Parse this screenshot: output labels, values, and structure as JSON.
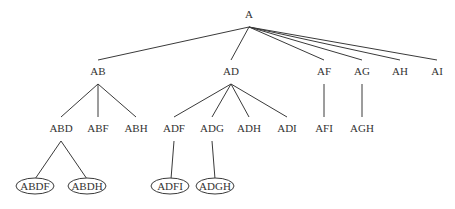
{
  "diagram": {
    "type": "tree",
    "colors": {
      "line": "#3a3a3a",
      "text": "#333333",
      "background": "#ffffff"
    },
    "nodes": [
      {
        "id": "A",
        "label": "A",
        "x": 249,
        "y": 14,
        "circled": false
      },
      {
        "id": "AB",
        "label": "AB",
        "x": 98,
        "y": 71,
        "circled": false
      },
      {
        "id": "AD",
        "label": "AD",
        "x": 231,
        "y": 71,
        "circled": false
      },
      {
        "id": "AF",
        "label": "AF",
        "x": 324,
        "y": 71,
        "circled": false
      },
      {
        "id": "AG",
        "label": "AG",
        "x": 362,
        "y": 71,
        "circled": false
      },
      {
        "id": "AH",
        "label": "AH",
        "x": 400,
        "y": 71,
        "circled": false
      },
      {
        "id": "AI",
        "label": "AI",
        "x": 437,
        "y": 71,
        "circled": false
      },
      {
        "id": "ABD",
        "label": "ABD",
        "x": 61,
        "y": 128,
        "circled": false
      },
      {
        "id": "ABF",
        "label": "ABF",
        "x": 98,
        "y": 128,
        "circled": false
      },
      {
        "id": "ABH",
        "label": "ABH",
        "x": 136,
        "y": 128,
        "circled": false
      },
      {
        "id": "ADF",
        "label": "ADF",
        "x": 174,
        "y": 128,
        "circled": false
      },
      {
        "id": "ADG",
        "label": "ADG",
        "x": 212,
        "y": 128,
        "circled": false
      },
      {
        "id": "ADH",
        "label": "ADH",
        "x": 249,
        "y": 128,
        "circled": false
      },
      {
        "id": "ADI",
        "label": "ADI",
        "x": 287,
        "y": 128,
        "circled": false
      },
      {
        "id": "AFI",
        "label": "AFI",
        "x": 324,
        "y": 128,
        "circled": false
      },
      {
        "id": "AGH",
        "label": "AGH",
        "x": 362,
        "y": 128,
        "circled": false
      },
      {
        "id": "ABDF",
        "label": "ABDF",
        "x": 35,
        "y": 186,
        "circled": true
      },
      {
        "id": "ABDH",
        "label": "ABDH",
        "x": 87,
        "y": 186,
        "circled": true
      },
      {
        "id": "ADFI",
        "label": "ADFI",
        "x": 170,
        "y": 186,
        "circled": true
      },
      {
        "id": "ADGH",
        "label": "ADGH",
        "x": 215,
        "y": 186,
        "circled": true
      }
    ],
    "edges": [
      {
        "from": "A",
        "to": "AB",
        "x1": 249,
        "y1": 27,
        "x2": 98,
        "y2": 60
      },
      {
        "from": "A",
        "to": "AD",
        "x1": 249,
        "y1": 27,
        "x2": 231,
        "y2": 60
      },
      {
        "from": "A",
        "to": "AF",
        "x1": 249,
        "y1": 27,
        "x2": 324,
        "y2": 60
      },
      {
        "from": "A",
        "to": "AG",
        "x1": 249,
        "y1": 27,
        "x2": 362,
        "y2": 60
      },
      {
        "from": "A",
        "to": "AH",
        "x1": 249,
        "y1": 27,
        "x2": 400,
        "y2": 60
      },
      {
        "from": "A",
        "to": "AI",
        "x1": 249,
        "y1": 27,
        "x2": 437,
        "y2": 60
      },
      {
        "from": "AB",
        "to": "ABD",
        "x1": 98,
        "y1": 84,
        "x2": 61,
        "y2": 117
      },
      {
        "from": "AB",
        "to": "ABF",
        "x1": 98,
        "y1": 84,
        "x2": 98,
        "y2": 117
      },
      {
        "from": "AB",
        "to": "ABH",
        "x1": 98,
        "y1": 84,
        "x2": 136,
        "y2": 117
      },
      {
        "from": "AD",
        "to": "ADF",
        "x1": 231,
        "y1": 84,
        "x2": 174,
        "y2": 117
      },
      {
        "from": "AD",
        "to": "ADG",
        "x1": 231,
        "y1": 84,
        "x2": 212,
        "y2": 117
      },
      {
        "from": "AD",
        "to": "ADH",
        "x1": 231,
        "y1": 84,
        "x2": 249,
        "y2": 117
      },
      {
        "from": "AD",
        "to": "ADI",
        "x1": 231,
        "y1": 84,
        "x2": 287,
        "y2": 117
      },
      {
        "from": "AF",
        "to": "AFI",
        "x1": 324,
        "y1": 84,
        "x2": 324,
        "y2": 117
      },
      {
        "from": "AG",
        "to": "AGH",
        "x1": 362,
        "y1": 84,
        "x2": 362,
        "y2": 117
      },
      {
        "from": "ABD",
        "to": "ABDF",
        "x1": 61,
        "y1": 141,
        "x2": 35,
        "y2": 179
      },
      {
        "from": "ABD",
        "to": "ABDH",
        "x1": 61,
        "y1": 141,
        "x2": 87,
        "y2": 179
      },
      {
        "from": "ADF",
        "to": "ADFI",
        "x1": 174,
        "y1": 141,
        "x2": 171,
        "y2": 179
      },
      {
        "from": "ADG",
        "to": "ADGH",
        "x1": 212,
        "y1": 141,
        "x2": 215,
        "y2": 179
      }
    ]
  }
}
